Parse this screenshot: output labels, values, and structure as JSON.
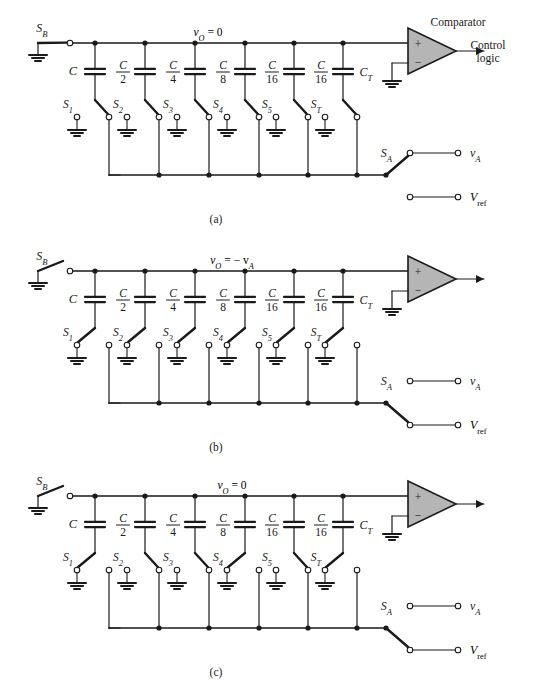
{
  "figure": {
    "kind": "charge-redistribution-successive-approximation-adc",
    "panels": [
      {
        "id": "a",
        "caption": "(a)",
        "node_label": "v_O = 0",
        "node_label_parts": {
          "v": "v",
          "sub": "O",
          "rest": "= 0"
        },
        "sb_label": "S_B",
        "sb_state": "closed",
        "sa_label": "S_A",
        "sa_state": "va",
        "va_label": "v_A",
        "vref_label": "V_ref",
        "comparator_label": "Comparator",
        "output_label_line1": "Control",
        "output_label_line2": "logic",
        "show_comparator_label": true,
        "show_output_label": true,
        "capacitors": [
          {
            "label": "C",
            "num": "C",
            "den": "",
            "switch": "S_1",
            "switch_sub": "1",
            "pos": "ref"
          },
          {
            "label": "C/2",
            "num": "C",
            "den": "2",
            "switch": "S_2",
            "switch_sub": "2",
            "pos": "ref"
          },
          {
            "label": "C/4",
            "num": "C",
            "den": "4",
            "switch": "S_3",
            "switch_sub": "3",
            "pos": "ref"
          },
          {
            "label": "C/8",
            "num": "C",
            "den": "8",
            "switch": "S_4",
            "switch_sub": "4",
            "pos": "ref"
          },
          {
            "label": "C/16",
            "num": "C",
            "den": "16",
            "switch": "S_5",
            "switch_sub": "5",
            "pos": "ref"
          },
          {
            "label": "C/16",
            "num": "C",
            "den": "16",
            "switch": "S_T",
            "switch_sub": "T",
            "pos": "ref"
          }
        ],
        "terminal_cap_label": "C_T",
        "terminal_cap_sub": "T"
      },
      {
        "id": "b",
        "caption": "(b)",
        "node_label": "v_O = - v_A",
        "node_label_parts": {
          "v": "v",
          "sub": "O",
          "rest": "= − v"
        },
        "sb_label": "S_B",
        "sb_state": "open",
        "sa_label": "S_A",
        "sa_state": "vref",
        "va_label": "v_A",
        "vref_label": "V_ref",
        "comparator_label": "",
        "output_label_line1": "",
        "output_label_line2": "",
        "show_comparator_label": false,
        "show_output_label": false,
        "capacitors": [
          {
            "label": "C",
            "num": "C",
            "den": "",
            "switch": "S_1",
            "switch_sub": "1",
            "pos": "gnd"
          },
          {
            "label": "C/2",
            "num": "C",
            "den": "2",
            "switch": "S_2",
            "switch_sub": "2",
            "pos": "gnd"
          },
          {
            "label": "C/4",
            "num": "C",
            "den": "4",
            "switch": "S_3",
            "switch_sub": "3",
            "pos": "gnd"
          },
          {
            "label": "C/8",
            "num": "C",
            "den": "8",
            "switch": "S_4",
            "switch_sub": "4",
            "pos": "gnd"
          },
          {
            "label": "C/16",
            "num": "C",
            "den": "16",
            "switch": "S_5",
            "switch_sub": "5",
            "pos": "gnd"
          },
          {
            "label": "C/16",
            "num": "C",
            "den": "16",
            "switch": "S_T",
            "switch_sub": "T",
            "pos": "gnd"
          }
        ],
        "terminal_cap_label": "C_T",
        "terminal_cap_sub": "T"
      },
      {
        "id": "c",
        "caption": "(c)",
        "node_label": "v_O = 0",
        "node_label_parts": {
          "v": "v",
          "sub": "O",
          "rest": "= 0"
        },
        "sb_label": "S_B",
        "sb_state": "open",
        "sa_label": "S_A",
        "sa_state": "vref",
        "va_label": "v_A",
        "vref_label": "V_ref",
        "comparator_label": "",
        "output_label_line1": "",
        "output_label_line2": "",
        "show_comparator_label": false,
        "show_output_label": false,
        "capacitors": [
          {
            "label": "C",
            "num": "C",
            "den": "",
            "switch": "S_1",
            "switch_sub": "1",
            "pos": "gnd"
          },
          {
            "label": "C/2",
            "num": "C",
            "den": "2",
            "switch": "S_2",
            "switch_sub": "2",
            "pos": "ref"
          },
          {
            "label": "C/4",
            "num": "C",
            "den": "4",
            "switch": "S_3",
            "switch_sub": "3",
            "pos": "ref"
          },
          {
            "label": "C/8",
            "num": "C",
            "den": "8",
            "switch": "S_4",
            "switch_sub": "4",
            "pos": "gnd"
          },
          {
            "label": "C/16",
            "num": "C",
            "den": "16",
            "switch": "S_5",
            "switch_sub": "5",
            "pos": "ref"
          },
          {
            "label": "C/16",
            "num": "C",
            "den": "16",
            "switch": "S_T",
            "switch_sub": "T",
            "pos": "gnd"
          }
        ],
        "terminal_cap_label": "C_T",
        "terminal_cap_sub": "T"
      }
    ],
    "comparator_plus": "+",
    "comparator_minus": "−",
    "colors": {
      "wire": "#1a1a1a",
      "comparator_fill": "#b5b5b5",
      "background": "#ffffff"
    }
  }
}
